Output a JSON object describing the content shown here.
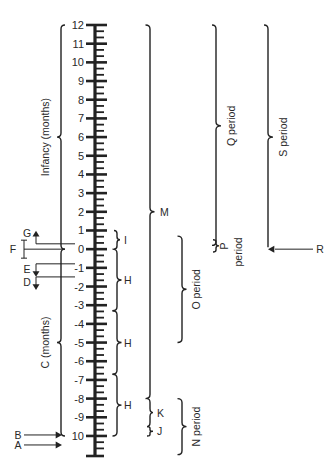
{
  "diagram": {
    "axis": {
      "ticks": [
        {
          "value": 12,
          "label": "12"
        },
        {
          "value": 11,
          "label": "11"
        },
        {
          "value": 10,
          "label": "10"
        },
        {
          "value": 9,
          "label": "9"
        },
        {
          "value": 8,
          "label": "8"
        },
        {
          "value": 7,
          "label": "7"
        },
        {
          "value": 6,
          "label": "6"
        },
        {
          "value": 5,
          "label": "5"
        },
        {
          "value": 4,
          "label": "4"
        },
        {
          "value": 3,
          "label": "3"
        },
        {
          "value": 2,
          "label": "2"
        },
        {
          "value": 1,
          "label": "1"
        },
        {
          "value": 0,
          "label": "0"
        },
        {
          "value": -1,
          "label": "-1"
        },
        {
          "value": -2,
          "label": "-2"
        },
        {
          "value": -3,
          "label": "-3"
        },
        {
          "value": -4,
          "label": "-4"
        },
        {
          "value": -5,
          "label": "-5"
        },
        {
          "value": -6,
          "label": "-6"
        },
        {
          "value": -7,
          "label": "-7"
        },
        {
          "value": -8,
          "label": "-8"
        },
        {
          "value": -9,
          "label": "-9"
        },
        {
          "value": -10,
          "label": "10"
        }
      ],
      "min": -10.5,
      "max": 12
    },
    "left_braces": [
      {
        "id": "infancy",
        "label": "Infancy (months)",
        "from": 0,
        "to": 12
      },
      {
        "id": "c",
        "label": "C (months)",
        "from": -10,
        "to": 0
      }
    ],
    "markers": [
      {
        "id": "G",
        "label": "G",
        "value": 0.5,
        "kind": "arrow-up"
      },
      {
        "id": "F",
        "label": "F",
        "value": 0,
        "kind": "range"
      },
      {
        "id": "E",
        "label": "E",
        "value": -1,
        "kind": "arrow-down"
      },
      {
        "id": "D",
        "label": "D",
        "value": -1.7,
        "kind": "arrow-down"
      },
      {
        "id": "B",
        "label": "B",
        "value": -10,
        "kind": "arrow-right"
      },
      {
        "id": "A",
        "label": "A",
        "value": -10.5,
        "kind": "arrow-right"
      }
    ],
    "right_braces": [
      {
        "id": "I",
        "label": "I",
        "from": 0,
        "to": 1,
        "column": 1
      },
      {
        "id": "H1",
        "label": "H",
        "from": -3.3,
        "to": 0,
        "column": 1
      },
      {
        "id": "H2",
        "label": "H",
        "from": -6.7,
        "to": -3.3,
        "column": 1
      },
      {
        "id": "H3",
        "label": "H",
        "from": -10,
        "to": -6.7,
        "column": 1
      },
      {
        "id": "M",
        "label": "M",
        "from": -8,
        "to": 12,
        "column": 2
      },
      {
        "id": "K",
        "label": "K",
        "from": -9.5,
        "to": -8,
        "column": 2
      },
      {
        "id": "J",
        "label": "J",
        "from": -10,
        "to": -9.5,
        "column": 2
      },
      {
        "id": "O",
        "label": "O period",
        "from": -5,
        "to": 0.7,
        "column": 3
      },
      {
        "id": "N",
        "label": "N period",
        "from": -11,
        "to": -8,
        "column": 3
      },
      {
        "id": "Q",
        "label": "Q period",
        "from": 0.2,
        "to": 12,
        "column": 4
      },
      {
        "id": "P",
        "label": "P period",
        "from": -0.2,
        "to": 0.5,
        "column": 4
      },
      {
        "id": "S",
        "label": "S period",
        "from": 0,
        "to": 12,
        "column": 5
      }
    ],
    "pointer_R": {
      "label": "R",
      "value": 0
    }
  }
}
